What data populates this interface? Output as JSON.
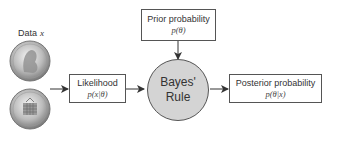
{
  "diagram": {
    "title": "Bayes' Rule",
    "data_label": "Data",
    "data_var": "x",
    "likelihood": {
      "label": "Likelihood",
      "formula": "p(x|θ)"
    },
    "prior": {
      "label": "Prior probability",
      "formula": "p(θ)"
    },
    "center": {
      "line1": "Bayes'",
      "line2": "Rule"
    },
    "posterior": {
      "label": "Posterior probability",
      "formula": "p(θ|x)"
    },
    "coins": [
      "coin-heads",
      "coin-tails"
    ],
    "colors": {
      "circle_fill": "#d4d4d4",
      "stroke": "#555555",
      "text": "#333333"
    }
  }
}
